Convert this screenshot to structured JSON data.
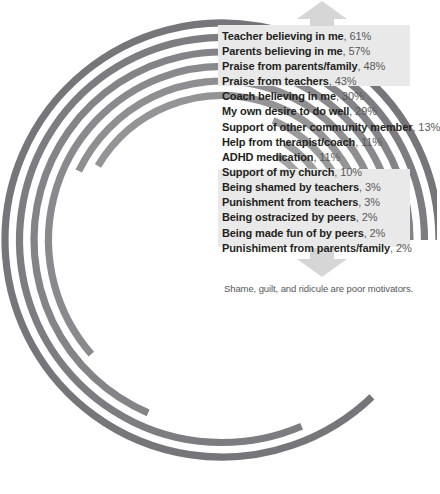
{
  "chart_data": {
    "type": "bar",
    "variant": "radial-concentric-arcs",
    "title": "",
    "subtitle": "",
    "xlabel": "",
    "ylabel": "",
    "units": "percent",
    "value_range": [
      0,
      100
    ],
    "grid": false,
    "legend": "none",
    "annotation": "Shame, guilt, and ridicule are poor motivators.",
    "categories": [
      "Teacher believing in me",
      "Parents believing in me",
      "Praise from parents/family",
      "Praise from teachers",
      "Coach believing in me",
      "My own desire to do well",
      "Support of other community member",
      "Help from therapist/coach",
      "ADHD medication",
      "Support of my church",
      "Being shamed by teachers",
      "Punishment from teachers",
      "Being ostracized by peers",
      "Being made fun of by peers",
      "Punishiment from parents/family"
    ],
    "values": [
      61,
      57,
      48,
      43,
      30,
      29,
      13,
      11,
      11,
      10,
      3,
      3,
      2,
      2,
      2
    ],
    "value_labels": [
      "61%",
      "57%",
      "48%",
      "43%",
      "30%",
      "29%",
      "13%",
      "11%",
      "11%",
      "10%",
      "3%",
      "3%",
      "2%",
      "2%",
      "2%"
    ],
    "highlight_groups": [
      {
        "name": "positive-motivators",
        "indices": [
          0,
          1,
          2,
          3
        ]
      },
      {
        "name": "negative-motivators",
        "indices": [
          10,
          11,
          12,
          13,
          14
        ]
      }
    ]
  },
  "rows": [
    {
      "name": "Teacher believing in me",
      "sep": ", ",
      "pct": "61%"
    },
    {
      "name": "Parents believing in me",
      "sep": ", ",
      "pct": "57%"
    },
    {
      "name": "Praise from parents/family",
      "sep": ", ",
      "pct": "48%"
    },
    {
      "name": "Praise from teachers",
      "sep": ", ",
      "pct": "43%"
    },
    {
      "name": "Coach believing in me",
      "sep": ", ",
      "pct": "30%"
    },
    {
      "name": "My own desire to do well",
      "sep": ", ",
      "pct": "29%"
    },
    {
      "name": "Support of other community member",
      "sep": ", ",
      "pct": "13%"
    },
    {
      "name": "Help from therapist/coach",
      "sep": ", ",
      "pct": "11%"
    },
    {
      "name": "ADHD medication",
      "sep": ", ",
      "pct": "11%"
    },
    {
      "name": "Support of my church",
      "sep": ", ",
      "pct": "10%"
    },
    {
      "name": "Being shamed by teachers",
      "sep": ", ",
      "pct": "3%"
    },
    {
      "name": "Punishment from teachers",
      "sep": ", ",
      "pct": "3%"
    },
    {
      "name": "Being ostracized by peers",
      "sep": ", ",
      "pct": "2%"
    },
    {
      "name": "Being made fun of by peers",
      "sep": ", ",
      "pct": "2%"
    },
    {
      "name": "Punishiment from parents/family",
      "sep": ", ",
      "pct": "2%"
    }
  ],
  "caption": {
    "text": "Shame, guilt, and ridicule are poor motivators."
  },
  "arrows": {
    "up": "arrow-up-icon",
    "down": "arrow-down-icon"
  },
  "colors": {
    "arc": "#8c8c8c",
    "arc_dark": "#6f6f72",
    "arc_light": "#a6a6a8",
    "highlight_band": "#e9e9e9",
    "arrow": "#d4d4d4",
    "label_text": "#231f20",
    "value_text": "#595959",
    "caption_text": "#58585a",
    "background": "#ffffff"
  },
  "geometry": {
    "center_x": 222,
    "center_y": 240,
    "outer_radius": 217,
    "ring_pitch": 14.5,
    "band_thickness": 7.2,
    "start_angle_deg": 0,
    "direction": "counter-clockwise",
    "full_sweep_percent": 70
  }
}
